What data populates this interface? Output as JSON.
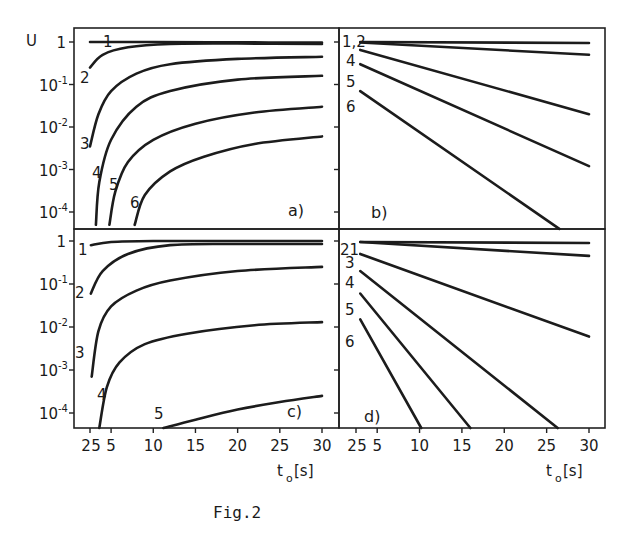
{
  "figure": {
    "caption": "Fig.2",
    "y_axis_symbol": "U",
    "x_axis_label": "t",
    "x_axis_subscript": "o",
    "x_axis_unit": "[s]"
  },
  "axes": {
    "y_ticks": [
      {
        "exp": 0,
        "label": "1",
        "sup": ""
      },
      {
        "exp": -1,
        "label": "10",
        "sup": "-1"
      },
      {
        "exp": -2,
        "label": "10",
        "sup": "-2"
      },
      {
        "exp": -3,
        "label": "10",
        "sup": "-3"
      },
      {
        "exp": -4,
        "label": "10",
        "sup": "-4"
      }
    ],
    "x_ticks": [
      {
        "value": 2.5,
        "label": "2"
      },
      {
        "value": 3.2,
        "label": "5"
      },
      {
        "value": 5,
        "label": "5"
      },
      {
        "value": 10,
        "label": "10"
      },
      {
        "value": 15,
        "label": "15"
      },
      {
        "value": 20,
        "label": "20"
      },
      {
        "value": 25,
        "label": "25"
      },
      {
        "value": 30,
        "label": "30"
      }
    ]
  },
  "chart_data": [
    {
      "type": "line",
      "panel": "a)",
      "title": "a)",
      "xlabel": "t0 [s]",
      "ylabel": "U",
      "yscale": "log",
      "xlim": [
        2.5,
        30
      ],
      "ylim": [
        4e-05,
        1.5
      ],
      "x_ticks": [
        2.5,
        5,
        10,
        15,
        20,
        25,
        30
      ],
      "y_ticks": [
        1,
        0.1,
        0.01,
        0.001,
        0.0001
      ],
      "series": [
        {
          "name": "1",
          "x": [
            2.5,
            10,
            20,
            30
          ],
          "values": [
            1.0,
            1.0,
            0.98,
            0.97
          ]
        },
        {
          "name": "2",
          "x": [
            2.5,
            4,
            7,
            12,
            20,
            30
          ],
          "values": [
            0.25,
            0.5,
            0.75,
            0.9,
            0.92,
            0.9
          ]
        },
        {
          "name": "3",
          "x": [
            2.5,
            3.5,
            5,
            8,
            12,
            20,
            30
          ],
          "values": [
            0.0035,
            0.02,
            0.07,
            0.18,
            0.3,
            0.4,
            0.45
          ]
        },
        {
          "name": "4",
          "x": [
            3.2,
            3.6,
            5,
            8,
            12,
            20,
            30
          ],
          "values": [
            5e-05,
            0.0005,
            0.005,
            0.03,
            0.07,
            0.13,
            0.16
          ]
        },
        {
          "name": "5",
          "x": [
            4.8,
            5.5,
            7,
            10,
            15,
            22,
            30
          ],
          "values": [
            5e-05,
            0.0003,
            0.0015,
            0.005,
            0.012,
            0.022,
            0.03
          ]
        },
        {
          "name": "6",
          "x": [
            7.8,
            9,
            12,
            16,
            22,
            30
          ],
          "values": [
            5e-05,
            0.00025,
            0.0009,
            0.002,
            0.004,
            0.006
          ]
        }
      ]
    },
    {
      "type": "line",
      "panel": "b)",
      "title": "b)",
      "xlabel": "t0 [s]",
      "ylabel": "U",
      "yscale": "log",
      "xlim": [
        2.5,
        30
      ],
      "ylim": [
        4e-05,
        1.5
      ],
      "series": [
        {
          "name": "1",
          "x": [
            3,
            30
          ],
          "values": [
            1.0,
            0.95
          ]
        },
        {
          "name": "2",
          "x": [
            3,
            30
          ],
          "values": [
            0.97,
            0.5
          ]
        },
        {
          "name": "4",
          "x": [
            3,
            30
          ],
          "values": [
            0.65,
            0.02
          ]
        },
        {
          "name": "5",
          "x": [
            3,
            30
          ],
          "values": [
            0.3,
            0.0012
          ]
        },
        {
          "name": "6",
          "x": [
            3,
            26.5
          ],
          "values": [
            0.07,
            4e-05
          ]
        }
      ]
    },
    {
      "type": "line",
      "panel": "c)",
      "title": "c)",
      "xlabel": "t0 [s]",
      "ylabel": "U",
      "yscale": "log",
      "xlim": [
        2.5,
        30
      ],
      "ylim": [
        4e-05,
        1.5
      ],
      "series": [
        {
          "name": "1",
          "x": [
            2.6,
            5,
            10,
            20,
            30
          ],
          "values": [
            0.8,
            0.95,
            1.0,
            1.0,
            1.0
          ]
        },
        {
          "name": "2",
          "x": [
            2.6,
            4,
            7,
            12,
            20,
            30
          ],
          "values": [
            0.06,
            0.2,
            0.5,
            0.8,
            0.85,
            0.85
          ]
        },
        {
          "name": "3",
          "x": [
            2.7,
            3.5,
            5,
            8,
            12,
            20,
            30
          ],
          "values": [
            0.0007,
            0.008,
            0.03,
            0.07,
            0.12,
            0.2,
            0.25
          ]
        },
        {
          "name": "4",
          "x": [
            3.6,
            4.5,
            6,
            9,
            14,
            22,
            30
          ],
          "values": [
            4e-05,
            0.0004,
            0.0015,
            0.004,
            0.007,
            0.011,
            0.013
          ]
        },
        {
          "name": "5",
          "x": [
            11.2,
            15,
            20,
            25,
            30
          ],
          "values": [
            4e-05,
            7e-05,
            0.00012,
            0.00018,
            0.00025
          ]
        }
      ]
    },
    {
      "type": "line",
      "panel": "d)",
      "title": "d)",
      "xlabel": "t0 [s]",
      "ylabel": "U",
      "yscale": "log",
      "xlim": [
        2.5,
        30
      ],
      "ylim": [
        4e-05,
        1.5
      ],
      "series": [
        {
          "name": "1",
          "x": [
            3,
            30
          ],
          "values": [
            0.95,
            0.9
          ]
        },
        {
          "name": "2",
          "x": [
            3,
            30
          ],
          "values": [
            0.95,
            0.45
          ]
        },
        {
          "name": "3",
          "x": [
            3,
            30
          ],
          "values": [
            0.5,
            0.006
          ]
        },
        {
          "name": "4",
          "x": [
            3,
            26.3
          ],
          "values": [
            0.2,
            4e-05
          ]
        },
        {
          "name": "5",
          "x": [
            3,
            16
          ],
          "values": [
            0.06,
            4e-05
          ]
        },
        {
          "name": "6",
          "x": [
            3,
            10.2
          ],
          "values": [
            0.015,
            4e-05
          ]
        }
      ]
    }
  ],
  "panel_label_positions": {
    "a)": {
      "series_labels": [
        {
          "name": "1",
          "x": 103,
          "y": 47
        },
        {
          "name": "2",
          "x": 80,
          "y": 83
        },
        {
          "name": "3",
          "x": 80,
          "y": 149
        },
        {
          "name": "4",
          "x": 92,
          "y": 178
        },
        {
          "name": "5",
          "x": 109,
          "y": 190
        },
        {
          "name": "6",
          "x": 130,
          "y": 208
        }
      ]
    },
    "b)": {
      "series_labels": [
        {
          "name": "1,2",
          "x": 342,
          "y": 47
        },
        {
          "name": "4",
          "x": 346,
          "y": 66
        },
        {
          "name": "5",
          "x": 346,
          "y": 87
        },
        {
          "name": "6",
          "x": 346,
          "y": 112
        }
      ]
    },
    "c)": {
      "series_labels": [
        {
          "name": "1",
          "x": 78,
          "y": 255
        },
        {
          "name": "2",
          "x": 75,
          "y": 298
        },
        {
          "name": "3",
          "x": 75,
          "y": 358
        },
        {
          "name": "4",
          "x": 97,
          "y": 400
        },
        {
          "name": "5",
          "x": 154,
          "y": 419
        }
      ]
    },
    "d)": {
      "series_labels": [
        {
          "name": "21",
          "x": 340,
          "y": 255
        },
        {
          "name": "3",
          "x": 345,
          "y": 268
        },
        {
          "name": "4",
          "x": 345,
          "y": 288
        },
        {
          "name": "5",
          "x": 345,
          "y": 315
        },
        {
          "name": "6",
          "x": 345,
          "y": 347
        }
      ]
    }
  }
}
